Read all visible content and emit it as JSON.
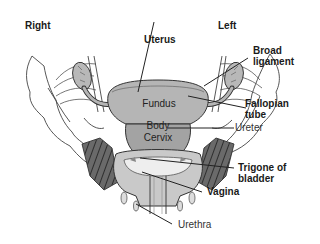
{
  "orientation": {
    "right": "Right",
    "left": "Left"
  },
  "labels": {
    "uterus": "Uterus",
    "broad_ligament": "Broad\nligament",
    "fallopian_tube": "Fallopian\ntube",
    "ureter": "Ureter",
    "trigone_of_bladder": "Trigone of\nbladder",
    "vagina": "Vagina",
    "urethra": "Urethra"
  },
  "uterus_parts": {
    "fundus": "Fundus",
    "body": "Body",
    "cervix": "Cervix"
  },
  "colors": {
    "uterus_fill": "#b5b5b5",
    "body_fill": "#a3a3a3",
    "bladder_hatch": "#555555",
    "outline": "#333333",
    "background": "#ffffff"
  }
}
